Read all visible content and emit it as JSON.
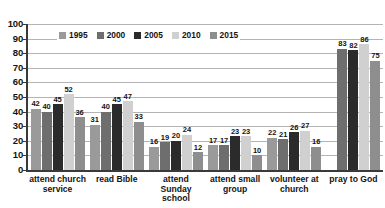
{
  "chart_data": {
    "type": "bar",
    "title": "",
    "subtitle": "",
    "xlabel": "",
    "ylabel": "",
    "ylim": [
      0,
      100
    ],
    "ytick_step": 10,
    "yticks": [
      100,
      90,
      80,
      70,
      60,
      50,
      40,
      30,
      20,
      10,
      0
    ],
    "grid": true,
    "grid_axis": "y",
    "legend_position": "top-left-inside",
    "categories": [
      "attend church service",
      "read Bible",
      "attend Sunday school",
      "attend small group",
      "volunteer at church",
      "pray to God"
    ],
    "series": [
      {
        "name": "1995",
        "color": "#9a9a9a",
        "values": [
          42,
          31,
          16,
          17,
          22,
          null
        ]
      },
      {
        "name": "2000",
        "color": "#6e6e6e",
        "values": [
          40,
          40,
          19,
          17,
          21,
          83
        ]
      },
      {
        "name": "2005",
        "color": "#2b2b2b",
        "values": [
          45,
          45,
          20,
          23,
          26,
          82
        ]
      },
      {
        "name": "2010",
        "color": "#d0d0d0",
        "values": [
          52,
          47,
          24,
          23,
          27,
          86
        ]
      },
      {
        "name": "2015",
        "color": "#8e8e8e",
        "values": [
          36,
          33,
          12,
          10,
          16,
          75
        ]
      }
    ]
  },
  "legend": {
    "items": [
      {
        "label": "1995",
        "color": "#9a9a9a"
      },
      {
        "label": "2000",
        "color": "#6e6e6e"
      },
      {
        "label": "2005",
        "color": "#2b2b2b"
      },
      {
        "label": "2010",
        "color": "#d0d0d0"
      },
      {
        "label": "2015",
        "color": "#8e8e8e"
      }
    ]
  },
  "axis_colors": {
    "axis_line": "#3a3a3a",
    "gridline": "#b4b4b4",
    "text": "#141414",
    "background": "#ffffff"
  }
}
